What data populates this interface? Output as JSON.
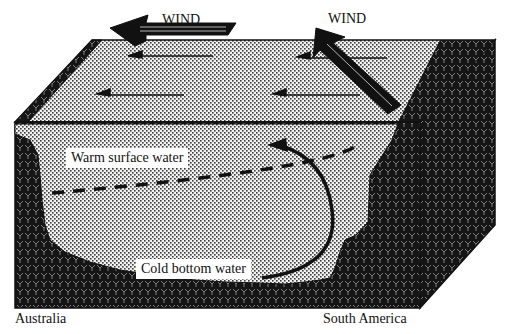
{
  "diagram": {
    "labels": {
      "wind_left": "WIND",
      "wind_right": "WIND",
      "warm_water": "Warm surface water",
      "cold_water": "Cold bottom water",
      "west_continent": "Australia",
      "east_continent": "South America"
    },
    "colors": {
      "land": "#1a1a1a",
      "land_pattern": "#8a8a8a",
      "water": "#d8d8d8",
      "water_dots": "#3a3a3a",
      "arrow": "#111111",
      "background": "#ffffff"
    },
    "elements": [
      {
        "name": "wind-arrow-left",
        "direction": "west"
      },
      {
        "name": "wind-arrow-right",
        "direction": "northwest"
      },
      {
        "name": "surface-current-arrows",
        "count": 4,
        "direction": "west"
      },
      {
        "name": "thermocline-dashed-line",
        "style": "dashed"
      },
      {
        "name": "upwelling-circulation-arrow",
        "style": "curved"
      }
    ]
  }
}
